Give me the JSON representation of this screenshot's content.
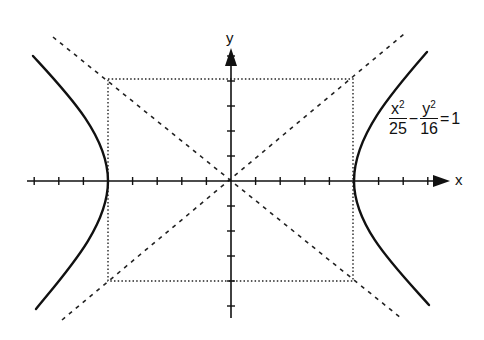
{
  "figure": {
    "type": "hyperbola-diagram",
    "axes": {
      "x_label": "x",
      "y_label": "y",
      "x_ticks_units": [
        -8,
        -7,
        -6,
        -5,
        -4,
        -3,
        -2,
        -1,
        1,
        2,
        3,
        4,
        5,
        6,
        7,
        8
      ],
      "y_ticks_units": [
        -5,
        -4,
        -3,
        -2,
        -1,
        1,
        2,
        3,
        4,
        5
      ]
    },
    "equation": {
      "term1_numerator": "x",
      "term1_exponent": "2",
      "term1_denominator": "25",
      "operator": "−",
      "term2_numerator": "y",
      "term2_exponent": "2",
      "term2_denominator": "16",
      "equals": "=",
      "rhs": "1"
    },
    "parameters": {
      "a": 5,
      "b": 4,
      "center": [
        0,
        0
      ]
    },
    "elements": {
      "hyperbola": "solid curve, two branches opening left/right, vertices at (±5, 0)",
      "asymptotes": "dashed lines y = ±(4/5)x",
      "fundamental_rectangle": "dotted rectangle with corners (±5, ±4)"
    },
    "colors": {
      "ink": "#111111",
      "background": "#ffffff"
    }
  }
}
